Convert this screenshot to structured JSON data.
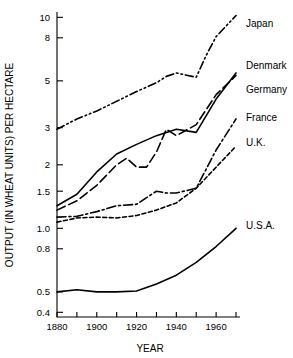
{
  "chart_data": {
    "type": "line",
    "title": "",
    "xlabel": "YEAR",
    "ylabel": "OUTPUT (IN WHEAT UNITS) PER HECTARE",
    "yscale": "log",
    "ylim": [
      0.38,
      10.6
    ],
    "xlim": [
      1880,
      1972
    ],
    "grid": false,
    "legend_position": "right-inline-labels",
    "y_ticks": [
      0.4,
      0.5,
      0.8,
      1.0,
      1.5,
      2,
      3,
      5,
      8,
      10
    ],
    "y_tick_labels": [
      "0.4",
      "0.5",
      "0.8",
      "1.0",
      "1.5",
      "2",
      "3",
      "5",
      "8",
      "10"
    ],
    "x_ticks": [
      1880,
      1900,
      1920,
      1940,
      1960
    ],
    "x_tick_labels": [
      "1880",
      "1900",
      "1920",
      "1940",
      "1960"
    ],
    "x_minor_ticks": [
      1890,
      1910,
      1930,
      1950,
      1970
    ],
    "series": [
      {
        "name": "Japan",
        "label": "Japan",
        "style": "dash-dot-dot",
        "label_x": 1972,
        "label_y": 9.3,
        "x": [
          1880,
          1890,
          1900,
          1910,
          1920,
          1930,
          1935,
          1940,
          1950,
          1955,
          1960,
          1970
        ],
        "values": [
          2.95,
          3.3,
          3.6,
          4.0,
          4.45,
          4.9,
          5.25,
          5.45,
          5.2,
          6.6,
          8.1,
          10.2
        ]
      },
      {
        "name": "Denmark",
        "label": "Denmark",
        "style": "solid",
        "label_x": 1972,
        "label_y": 5.9,
        "x": [
          1880,
          1890,
          1900,
          1910,
          1920,
          1930,
          1940,
          1950,
          1960,
          1970
        ],
        "values": [
          1.28,
          1.45,
          1.85,
          2.25,
          2.5,
          2.75,
          2.95,
          2.85,
          4.1,
          5.45
        ]
      },
      {
        "name": "Germany",
        "label": "Germany",
        "style": "long-dash",
        "label_x": 1972,
        "label_y": 4.55,
        "x": [
          1880,
          1890,
          1900,
          1910,
          1915,
          1920,
          1925,
          1930,
          1935,
          1940,
          1950,
          1960,
          1970
        ],
        "values": [
          1.22,
          1.35,
          1.6,
          2.0,
          2.15,
          1.95,
          1.95,
          2.3,
          2.95,
          2.75,
          3.1,
          4.3,
          5.3
        ]
      },
      {
        "name": "France",
        "label": "France",
        "style": "dash-dot",
        "label_x": 1972,
        "label_y": 3.35,
        "x": [
          1880,
          1890,
          1900,
          1910,
          1920,
          1930,
          1935,
          1940,
          1950,
          1960,
          1970
        ],
        "values": [
          1.13,
          1.14,
          1.2,
          1.28,
          1.3,
          1.5,
          1.47,
          1.47,
          1.55,
          2.35,
          3.3
        ]
      },
      {
        "name": "U.K.",
        "label": "U.K.",
        "style": "dotted-dash",
        "label_x": 1972,
        "label_y": 2.55,
        "x": [
          1880,
          1890,
          1900,
          1910,
          1920,
          1930,
          1940,
          1950,
          1960,
          1970
        ],
        "values": [
          1.07,
          1.12,
          1.13,
          1.12,
          1.15,
          1.22,
          1.32,
          1.55,
          1.95,
          2.45
        ]
      },
      {
        "name": "U.S.A.",
        "label": "U.S.A.",
        "style": "solid",
        "label_x": 1972,
        "label_y": 1.03,
        "x": [
          1880,
          1890,
          1900,
          1910,
          1920,
          1930,
          1940,
          1950,
          1960,
          1970
        ],
        "values": [
          0.5,
          0.512,
          0.5,
          0.5,
          0.505,
          0.545,
          0.6,
          0.69,
          0.82,
          1.0
        ]
      }
    ]
  },
  "axis": {
    "x_title": "YEAR",
    "y_title": "OUTPUT (IN WHEAT UNITS) PER HECTARE"
  }
}
